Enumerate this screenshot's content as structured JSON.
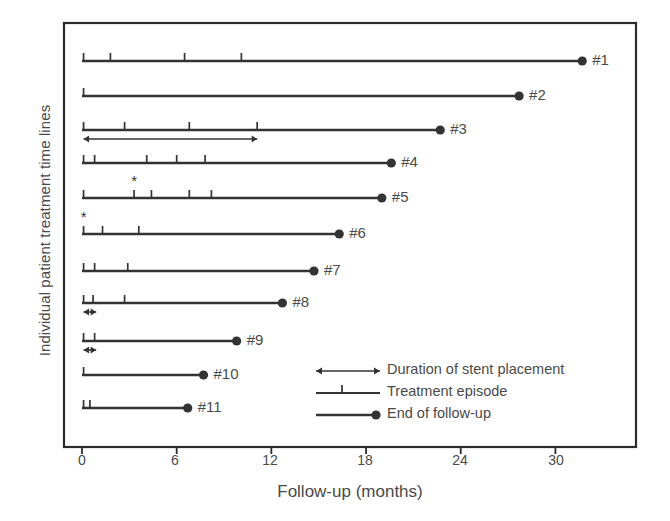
{
  "chart_data": {
    "type": "timeline",
    "title": "",
    "xlabel": "Follow-up (months)",
    "ylabel": "Individual patient treatment time lines",
    "xlim": [
      0,
      35
    ],
    "xticks": [
      0,
      6,
      12,
      18,
      24,
      30
    ],
    "xticklabels": [
      "0",
      "6",
      "12",
      "18",
      "24",
      "30"
    ],
    "grid": false,
    "legend_position": "inside-bottom-right",
    "legend": [
      {
        "key": "stent",
        "symbol": "double-arrow",
        "label": "Duration of stent placement"
      },
      {
        "key": "episode",
        "symbol": "tick-mark",
        "label": "Treatment episode"
      },
      {
        "key": "followup",
        "symbol": "line-dot",
        "label": "End of follow-up"
      }
    ],
    "patients": [
      {
        "label": "#1",
        "followup_months": 31.7,
        "episodes": [
          0.1,
          1.8,
          6.5,
          10.1
        ],
        "stent": null,
        "asterisk": null
      },
      {
        "label": "#2",
        "followup_months": 27.7,
        "episodes": [
          0.1
        ],
        "stent": null,
        "asterisk": null
      },
      {
        "label": "#3",
        "followup_months": 22.7,
        "episodes": [
          0.1,
          2.7,
          6.8,
          11.1
        ],
        "stent": {
          "start": 0.1,
          "end": 11.1
        },
        "asterisk": null
      },
      {
        "label": "#4",
        "followup_months": 19.6,
        "episodes": [
          0.1,
          0.8,
          4.1,
          6.0,
          7.8
        ],
        "stent": null,
        "asterisk": null
      },
      {
        "label": "#5",
        "followup_months": 19.0,
        "episodes": [
          0.1,
          3.3,
          4.4,
          6.8,
          8.2
        ],
        "stent": null,
        "asterisk": 3.3
      },
      {
        "label": "#6",
        "followup_months": 16.3,
        "episodes": [
          0.1,
          1.3,
          3.6
        ],
        "stent": null,
        "asterisk": 0.1
      },
      {
        "label": "#7",
        "followup_months": 14.7,
        "episodes": [
          0.1,
          0.8,
          2.9
        ],
        "stent": null,
        "asterisk": null
      },
      {
        "label": "#8",
        "followup_months": 12.7,
        "episodes": [
          0.1,
          0.7,
          2.7
        ],
        "stent": {
          "start": 0.1,
          "end": 0.9
        },
        "asterisk": null
      },
      {
        "label": "#9",
        "followup_months": 9.8,
        "episodes": [
          0.1,
          0.8
        ],
        "stent": {
          "start": 0.1,
          "end": 0.9
        },
        "asterisk": null
      },
      {
        "label": "#10",
        "followup_months": 7.7,
        "episodes": [
          0.1
        ],
        "stent": null,
        "asterisk": null
      },
      {
        "label": "#11",
        "followup_months": 6.7,
        "episodes": [
          0.1,
          0.5
        ],
        "stent": null,
        "asterisk": null
      }
    ],
    "colors": {
      "line": "#333333",
      "frame": "#2b2b2b",
      "text": "#4a4a4a"
    }
  },
  "axis": {
    "x_title": "Follow-up (months)",
    "y_title": "Individual patient treatment time lines",
    "tick_0": "0",
    "tick_6": "6",
    "tick_12": "12",
    "tick_18": "18",
    "tick_24": "24",
    "tick_30": "30"
  },
  "legend_text": {
    "stent": "Duration of stent placement",
    "episode": "Treatment episode",
    "followup": "End of follow-up"
  }
}
